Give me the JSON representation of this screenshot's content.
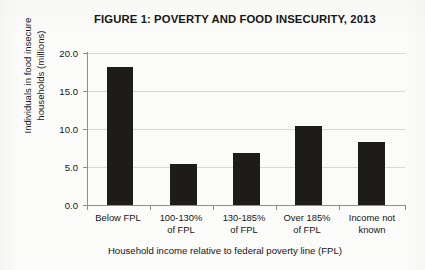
{
  "chart_data": {
    "type": "bar",
    "title": "FIGURE 1: POVERTY AND FOOD INSECURITY, 2013",
    "xlabel": "Household income relative to federal poverty line (FPL)",
    "ylabel": "Individuals in food insecure households (millions)",
    "ylabel_line1": "Individuals in food insecure",
    "ylabel_line2": "households (millions)",
    "categories": [
      "Below FPL",
      "100-130% of FPL",
      "130-185% of FPL",
      "Over 185% of FPL",
      "Income not known"
    ],
    "category_lines": [
      [
        "Below FPL",
        ""
      ],
      [
        "100-130%",
        "of FPL"
      ],
      [
        "130-185%",
        "of FPL"
      ],
      [
        "Over 185%",
        "of FPL"
      ],
      [
        "Income not",
        "known"
      ]
    ],
    "values": [
      18.2,
      5.4,
      6.8,
      10.4,
      8.3
    ],
    "ylim": [
      0.0,
      20.0
    ],
    "ytick_labels": [
      "20.0",
      "15.0",
      "10.0",
      "5.0",
      "0.0"
    ],
    "ytick_values": [
      20.0,
      15.0,
      10.0,
      5.0,
      0.0
    ],
    "grid": true,
    "legend": "none",
    "bar_color": "#1d1c1a",
    "grid_color": "#d8d8d6",
    "axis_color": "#8e8e8c",
    "background_color": "#fbfbfa"
  }
}
